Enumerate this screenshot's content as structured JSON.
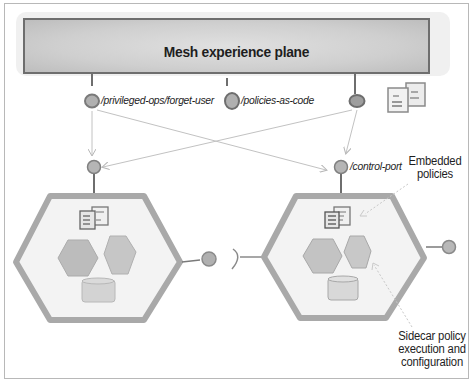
{
  "diagram": {
    "plane": {
      "title": "Mesh experience plane"
    },
    "endpoints": [
      {
        "id": "forget-user",
        "label": "/privileged-ops/forget-user"
      },
      {
        "id": "policies-as-code",
        "label": "/policies-as-code"
      },
      {
        "id": "third",
        "label": ""
      }
    ],
    "nodes": [
      {
        "id": "left-node",
        "control_port_label": ""
      },
      {
        "id": "right-node",
        "control_port_label": "/control-port"
      }
    ],
    "annotations": {
      "embedded_policies": "Embedded\npolicies",
      "embedded_policies_line1": "Embedded",
      "embedded_policies_line2": "policies",
      "sidecar_line1": "Sidecar policy",
      "sidecar_line2": "execution and",
      "sidecar_line3": "configuration"
    },
    "colors": {
      "plane_fill": "#d4d4d4",
      "plane_border": "#6e6e6e",
      "hex_border": "#a9a9a9",
      "hex_fill": "#f2f2f2",
      "port_fill": "#b3b3b3",
      "port_stroke": "#7a7a7a",
      "arrow": "#c2c2c2",
      "text": "#1e1e1e"
    }
  }
}
